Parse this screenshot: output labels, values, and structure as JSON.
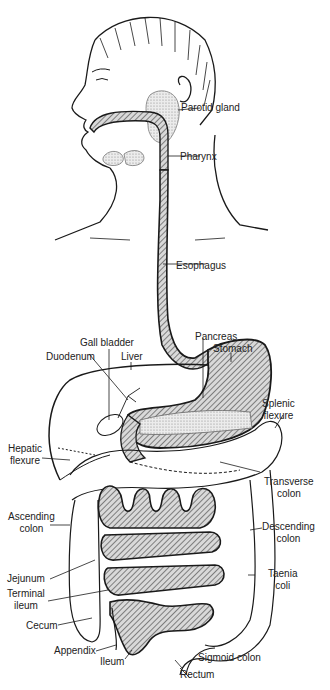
{
  "diagram": {
    "colors": {
      "ink": "#1a1a1a",
      "hatch": "#555555",
      "stipple": "#c8c8c8",
      "background": "#ffffff"
    },
    "labels": {
      "parotid_gland": "Parotid gland",
      "pharynx": "Pharynx",
      "esophagus": "Esophagus",
      "gall_bladder": "Gall bladder",
      "pancreas": "Pancreas",
      "stomach": "Stomach",
      "duodenum": "Duodenum",
      "liver": "Liver",
      "splenic_flexure_1": "Splenic",
      "splenic_flexure_2": "flexure",
      "hepatic_flexure_1": "Hepatic",
      "hepatic_flexure_2": "flexure",
      "transverse_colon_1": "Transverse",
      "transverse_colon_2": "colon",
      "ascending_colon_1": "Ascending",
      "ascending_colon_2": "colon",
      "descending_colon_1": "Descending",
      "descending_colon_2": "colon",
      "jejunum": "Jejunum",
      "terminal_ileum_1": "Terminal",
      "terminal_ileum_2": "ileum",
      "taenia_coli_1": "Taenia",
      "taenia_coli_2": "coli",
      "cecum": "Cecum",
      "appendix": "Appendix",
      "ileum": "Ileum",
      "sigmoid_colon": "Sigmoid colon",
      "rectum": "Rectum"
    }
  }
}
